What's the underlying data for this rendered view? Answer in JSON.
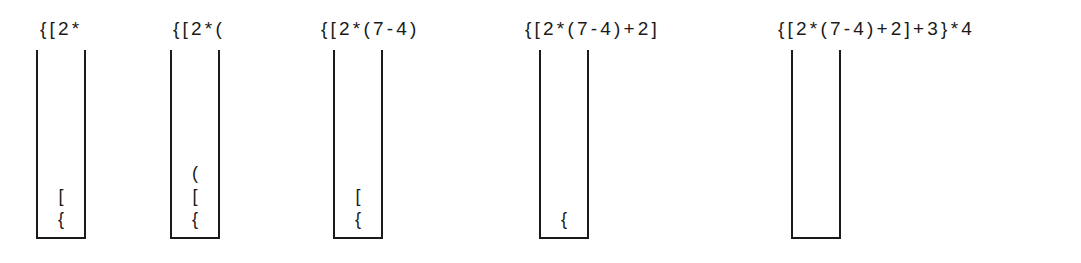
{
  "colors": {
    "ink": "#1a1a1a",
    "background": "#ffffff"
  },
  "steps": [
    {
      "expression": "{[2*",
      "stack_bottom_to_top": [
        "{",
        "["
      ]
    },
    {
      "expression": "{[2*(",
      "stack_bottom_to_top": [
        "{",
        "[",
        "("
      ]
    },
    {
      "expression": "{[2*(7-4)",
      "stack_bottom_to_top": [
        "{",
        "["
      ]
    },
    {
      "expression": "{[2*(7-4)+2]",
      "stack_bottom_to_top": [
        "{"
      ]
    },
    {
      "expression": "{[2*(7-4)+2]+3}*4",
      "stack_bottom_to_top": []
    }
  ]
}
